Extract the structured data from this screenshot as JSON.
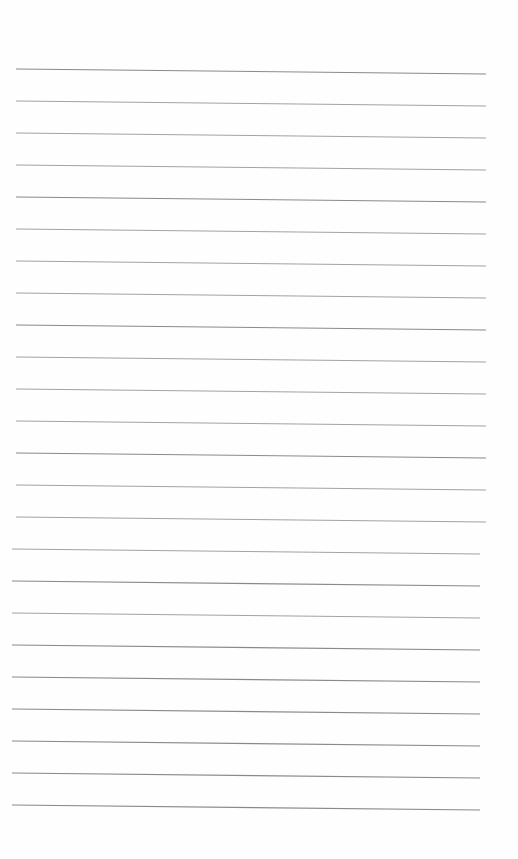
{
  "page": {
    "type": "blank lined sheet",
    "background_color": "#fefefe",
    "line_color": "#8a8a8a",
    "line_count": 24,
    "first_line_y": 69,
    "line_spacing": 32.0,
    "line_start_x": 16,
    "line_end_x": 486
  }
}
